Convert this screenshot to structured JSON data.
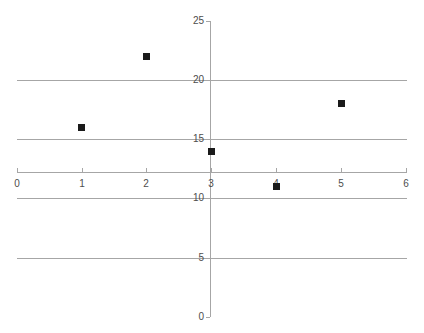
{
  "chart_data": {
    "type": "scatter",
    "title": "",
    "subtitle": "",
    "xlabel": "",
    "ylabel": "",
    "x": [
      1,
      2,
      3,
      4,
      5
    ],
    "values": [
      16,
      22,
      14,
      11,
      18
    ],
    "points": [
      {
        "x": 1,
        "y": 16
      },
      {
        "x": 2,
        "y": 22
      },
      {
        "x": 3,
        "y": 14
      },
      {
        "x": 4,
        "y": 11
      },
      {
        "x": 5,
        "y": 18
      }
    ],
    "series": [
      {
        "name": "Series 1",
        "x": [
          1,
          2,
          3,
          4,
          5
        ],
        "values": [
          16,
          22,
          14,
          11,
          18
        ]
      }
    ],
    "xlim": [
      0,
      6
    ],
    "ylim": [
      0,
      25
    ],
    "x_ticks": [
      "0",
      "1",
      "2",
      "3",
      "4",
      "5",
      "6"
    ],
    "x_tick_values": [
      0,
      1,
      2,
      3,
      4,
      5,
      6
    ],
    "y_ticks": [
      "0",
      "5",
      "10",
      "15",
      "20",
      "25"
    ],
    "y_tick_values": [
      0,
      5,
      10,
      15,
      20,
      25
    ],
    "grid": true,
    "grid_axis": "y",
    "legend": false,
    "legend_position": "none",
    "marker": "square",
    "marker_color": "#1a1a1a",
    "axis_color": "#a6a6a6",
    "gridline_color": "#a6a6a6",
    "tick_label_color": "#4d4d4d",
    "background_color": "#ffffff",
    "annotations": []
  }
}
